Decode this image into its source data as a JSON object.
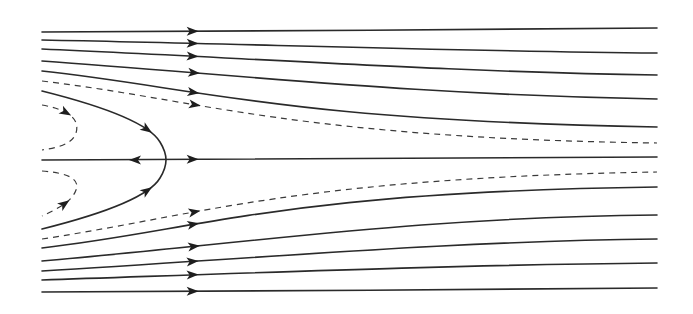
{
  "diagram": {
    "type": "streamline-flow-pattern",
    "colors": {
      "background": "#ffffff",
      "line": "#2a2a2a",
      "dashed_line": "#3a3a3a",
      "arrow": "#1e1e1e"
    },
    "arrow_column_x": 193,
    "stagnation_point": {
      "x": 166,
      "y": 160
    },
    "streamlines": [
      {
        "id": "s1",
        "style": "solid",
        "d": "M42,32 C250,31 450,30 657,28",
        "arrow": [
          193,
          31
        ]
      },
      {
        "id": "s2",
        "style": "solid",
        "d": "M42,40 C250,44 450,51 657,53",
        "arrow": [
          193,
          43
        ]
      },
      {
        "id": "s3",
        "style": "solid",
        "d": "M42,49 C250,58 450,72 657,75",
        "arrow": [
          193,
          60
        ]
      },
      {
        "id": "s4",
        "style": "solid",
        "d": "M42,61 C250,76 420,95 657,99",
        "arrow": [
          193,
          78
        ]
      },
      {
        "id": "s5",
        "style": "solid",
        "d": "M42,71 C200,88 280,120 657,127",
        "arrow": [
          193,
          98
        ]
      },
      {
        "id": "d1",
        "style": "dashed",
        "d": "M42,81 C200,100 300,138 657,143",
        "arrow": [
          193,
          116
        ]
      },
      {
        "id": "s6",
        "style": "solid",
        "d": "M42,91 C100,105 140,118 152,135",
        "arrow": [
          148,
          128
        ]
      },
      {
        "id": "c0",
        "style": "solid",
        "d": "M42,160 L657,157",
        "arrow": [
          193,
          160
        ]
      },
      {
        "id": "d2",
        "style": "dashed",
        "d": "M42,239 C200,215 300,178 657,172",
        "arrow": [
          193,
          202
        ]
      },
      {
        "id": "s7",
        "style": "solid",
        "d": "M42,248 C200,230 280,192 657,187",
        "arrow": [
          193,
          219
        ]
      },
      {
        "id": "s8",
        "style": "solid",
        "d": "M42,261 C250,243 420,217 657,215",
        "arrow": [
          193,
          241
        ]
      },
      {
        "id": "s9",
        "style": "solid",
        "d": "M42,271 C250,259 450,241 657,239",
        "arrow": [
          193,
          258
        ]
      },
      {
        "id": "s10",
        "style": "solid",
        "d": "M42,280 C250,273 450,265 657,263",
        "arrow": [
          193,
          273
        ]
      },
      {
        "id": "s11",
        "style": "solid",
        "d": "M42,292 C250,291 450,290 657,288",
        "arrow": [
          193,
          291
        ]
      }
    ],
    "parabola": {
      "style": "solid",
      "d": "M42,91 C110,108 150,125 160,142 C168,155 168,165 160,178 C150,195 110,212 42,229",
      "arrows": [
        [
          148,
          128
        ],
        [
          148,
          192
        ]
      ]
    },
    "reverse_arrow": {
      "x": 135,
      "y": 160,
      "direction": "left"
    },
    "loops": [
      {
        "id": "loop-top",
        "style": "dashed",
        "d": "M42,105 C70,110 80,120 76,133 C72,145 55,148 42,150",
        "arrow": [
          64,
          116
        ]
      },
      {
        "id": "loop-bottom",
        "style": "dashed",
        "d": "M42,171 C70,173 80,180 76,190 C72,202 55,210 42,216",
        "arrow": [
          64,
          203
        ]
      }
    ]
  }
}
